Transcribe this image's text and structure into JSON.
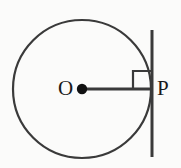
{
  "figure": {
    "type": "geometry-diagram",
    "background_color": "#fbfbfa",
    "stroke_color": "#3a3a3a",
    "accent_color": "#111111",
    "labels": {
      "center_label": "O",
      "tangent_point_label": "P"
    },
    "elements": {
      "circle": {
        "name": "circle",
        "center_x": 82,
        "center_y": 89,
        "radius": 69,
        "stroke_width": 2.2
      },
      "center_dot": {
        "name": "center-point",
        "cx": 82,
        "cy": 89,
        "r": 5.2
      },
      "radius_segment": {
        "name": "radius-OP",
        "x1": 82,
        "y1": 89,
        "x2": 152,
        "y2": 89,
        "stroke_width": 3
      },
      "tangent_line": {
        "name": "tangent-line",
        "x": 152,
        "y_top": 30,
        "y_bottom": 157,
        "stroke_width": 3
      },
      "right_angle_marker": {
        "name": "right-angle-marker",
        "x_left": 133,
        "x_right": 152,
        "y_top": 71,
        "y_bottom": 89,
        "stroke_width": 2.2
      }
    }
  }
}
